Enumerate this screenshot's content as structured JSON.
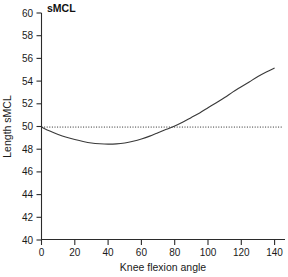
{
  "chart_data": {
    "type": "line",
    "title": "sMCL",
    "xlabel": "Knee flexion angle",
    "ylabel": "Length sMCL",
    "xlim": [
      0,
      145
    ],
    "ylim": [
      40,
      60
    ],
    "xticks": [
      0,
      20,
      40,
      60,
      80,
      100,
      120,
      140
    ],
    "yticks": [
      40,
      42,
      44,
      46,
      48,
      50,
      52,
      54,
      56,
      58,
      60
    ],
    "grid": false,
    "legend": "none",
    "series": [
      {
        "name": "sMCL length",
        "style": "solid",
        "color": "#3a3a3a",
        "x": [
          0,
          5,
          10,
          15,
          20,
          25,
          30,
          35,
          40,
          45,
          50,
          55,
          60,
          65,
          70,
          75,
          80,
          85,
          90,
          95,
          100,
          105,
          110,
          115,
          120,
          125,
          130,
          135,
          140
        ],
        "y": [
          49.95,
          49.6,
          49.3,
          49.05,
          48.85,
          48.68,
          48.55,
          48.48,
          48.45,
          48.47,
          48.55,
          48.7,
          48.9,
          49.15,
          49.45,
          49.75,
          50.05,
          50.4,
          50.8,
          51.2,
          51.65,
          52.1,
          52.55,
          53.05,
          53.5,
          53.95,
          54.4,
          54.8,
          55.15
        ]
      },
      {
        "name": "reference at 50",
        "style": "dotted",
        "color": "#2b2b2b",
        "x": [
          0,
          145
        ],
        "y": [
          49.95,
          49.95
        ]
      }
    ],
    "annotations": {
      "reference_value": 50,
      "minimum_value": 48.45,
      "minimum_at_angle": 40,
      "crossing_angle": 80,
      "end_value": 55.15
    }
  },
  "colors": {
    "axis": "#2b2b2b",
    "curve": "#3a3a3a",
    "reference": "#2b2b2b",
    "background": "#ffffff"
  }
}
